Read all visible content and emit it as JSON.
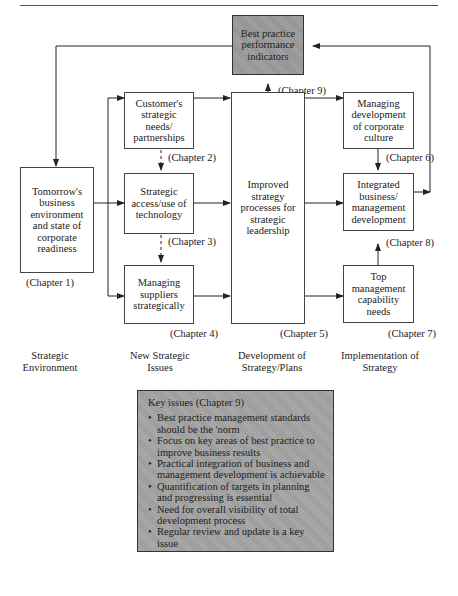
{
  "figure": {
    "boxes": {
      "indicators": {
        "text": "Best practice performance indicators",
        "chapter": "(Chapter 9)"
      },
      "environment": {
        "text": "Tomorrow's business environment and state of corporate readiness",
        "chapter": "(Chapter 1)"
      },
      "customer": {
        "text": "Customer's strategic needs/ partnerships",
        "chapter": "(Chapter 2)"
      },
      "technology": {
        "text": "Strategic access/use of technology",
        "chapter": "(Chapter 3)"
      },
      "suppliers": {
        "text": "Managing suppliers strategically",
        "chapter": "(Chapter 4)"
      },
      "processes": {
        "text": "Improved strategy processes for strategic leadership",
        "chapter": "(Chapter 5)"
      },
      "culture": {
        "text": "Managing development of corporate culture",
        "chapter": "(Chapter 6)"
      },
      "top_management": {
        "text": "Top management capability needs",
        "chapter": "(Chapter 7)"
      },
      "integrated": {
        "text": "Integrated business/ management development",
        "chapter": "(Chapter 8)"
      }
    },
    "columns": [
      {
        "label": "Strategic Environment"
      },
      {
        "label": "New Strategic Issues"
      },
      {
        "label": "Development of Strategy/Plans"
      },
      {
        "label": "Implementation of Strategy"
      }
    ],
    "key_issues": {
      "title": "Key issues (Chapter 9)",
      "items": [
        "Best practice management standards should be the 'norm",
        "Focus on key areas of best practice to improve business results",
        "Practical integration of business and management development is achievable",
        "Quantification of targets in planning and progressing is essential",
        "Need for overall visibility of total development process",
        "Regular review and update is a key issue"
      ]
    },
    "colors": {
      "shaded_box": "#9a9a9a",
      "key_box": "#a3a3a3",
      "line": "#222222"
    }
  }
}
